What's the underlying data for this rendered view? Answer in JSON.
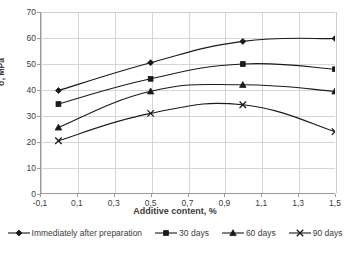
{
  "chart_data": {
    "type": "line",
    "title": "",
    "xlabel": "Additive content, %",
    "ylabel": "σ, MPa",
    "xlim": [
      -0.1,
      1.5
    ],
    "ylim": [
      0,
      70
    ],
    "grid": true,
    "legend_position": "bottom",
    "x": [
      0,
      0.5,
      1.0,
      1.5
    ],
    "xticks": [
      -0.1,
      0.1,
      0.3,
      0.5,
      0.7,
      0.9,
      1.1,
      1.3,
      1.5
    ],
    "xticklabels": [
      "-0,1",
      "0,1",
      "0,3",
      "0,5",
      "0,7",
      "0,9",
      "1,1",
      "1,3",
      "1,5"
    ],
    "yticks": [
      0,
      10,
      20,
      30,
      40,
      50,
      60,
      70
    ],
    "yticklabels": [
      "0",
      "10",
      "20",
      "30",
      "40",
      "50",
      "60",
      "70"
    ],
    "series": [
      {
        "name": "Immediately after preparation",
        "marker": "diamond",
        "color": "#1a1a1a",
        "values": [
          39.8,
          50.5,
          58.7,
          59.8
        ]
      },
      {
        "name": "30 days",
        "marker": "square",
        "color": "#1a1a1a",
        "values": [
          34.6,
          44.3,
          50.0,
          48.0
        ]
      },
      {
        "name": "60 days",
        "marker": "triangle",
        "color": "#1a1a1a",
        "values": [
          25.6,
          39.5,
          42.0,
          39.5
        ]
      },
      {
        "name": "90 days",
        "marker": "cross",
        "color": "#1a1a1a",
        "values": [
          20.5,
          31.0,
          34.3,
          24.0
        ]
      }
    ]
  },
  "legend": {
    "items": [
      {
        "label": "Immediately after preparation",
        "marker": "diamond"
      },
      {
        "label": "30 days",
        "marker": "square"
      },
      {
        "label": "60 days",
        "marker": "triangle"
      },
      {
        "label": "90 days",
        "marker": "cross"
      }
    ]
  },
  "colors": {
    "line": "#1a1a1a",
    "grid": "#d6d6d6",
    "axis": "#9a9a9a",
    "text": "#3b3b3b",
    "background": "#ffffff"
  }
}
